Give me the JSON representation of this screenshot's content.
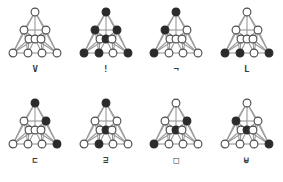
{
  "canvas": {
    "width": 282,
    "height": 182,
    "background": "#ffffff"
  },
  "style": {
    "edge_color": "#9a9a9a",
    "node_outline_color": "#4a4a4a",
    "node_open_fill": "#ffffff",
    "node_filled_fill": "#2b2b2b",
    "label_color": "#3a3a3a"
  },
  "graph_template": {
    "description": "Triangular tetractys-style graph with 10 nodes arranged in 4 rows and interior cross edges",
    "node_ids": [
      "apex",
      "u_left",
      "u_right",
      "m_left",
      "m_center",
      "m_right",
      "b_left",
      "b_center_left",
      "b_center_right",
      "b_right"
    ],
    "node_positions": [
      {
        "id": "apex",
        "x": 31,
        "y": 6
      },
      {
        "id": "u_left",
        "x": 20,
        "y": 24
      },
      {
        "id": "u_right",
        "x": 42,
        "y": 24
      },
      {
        "id": "m_left",
        "x": 25,
        "y": 33
      },
      {
        "id": "m_center",
        "x": 31,
        "y": 33
      },
      {
        "id": "m_right",
        "x": 37,
        "y": 33
      },
      {
        "id": "b_left",
        "x": 9,
        "y": 47
      },
      {
        "id": "b_center_left",
        "x": 24,
        "y": 47
      },
      {
        "id": "b_center_right",
        "x": 38,
        "y": 47
      },
      {
        "id": "b_right",
        "x": 53,
        "y": 47
      }
    ],
    "edges": [
      [
        "apex",
        "u_left"
      ],
      [
        "apex",
        "u_right"
      ],
      [
        "apex",
        "m_center"
      ],
      [
        "apex",
        "b_left"
      ],
      [
        "apex",
        "b_right"
      ],
      [
        "u_left",
        "u_right"
      ],
      [
        "u_left",
        "m_left"
      ],
      [
        "u_left",
        "m_center"
      ],
      [
        "u_right",
        "m_center"
      ],
      [
        "u_right",
        "m_right"
      ],
      [
        "u_left",
        "b_left"
      ],
      [
        "u_left",
        "b_center_left"
      ],
      [
        "u_right",
        "b_center_right"
      ],
      [
        "u_right",
        "b_right"
      ],
      [
        "m_left",
        "m_center"
      ],
      [
        "m_center",
        "m_right"
      ],
      [
        "m_left",
        "b_left"
      ],
      [
        "m_left",
        "b_center_left"
      ],
      [
        "m_center",
        "b_center_left"
      ],
      [
        "m_center",
        "b_center_right"
      ],
      [
        "m_right",
        "b_center_right"
      ],
      [
        "m_right",
        "b_right"
      ],
      [
        "b_left",
        "b_center_left"
      ],
      [
        "b_center_left",
        "b_center_right"
      ],
      [
        "b_center_right",
        "b_right"
      ],
      [
        "b_left",
        "m_center"
      ],
      [
        "b_right",
        "m_center"
      ]
    ]
  },
  "figures": [
    {
      "index": 1,
      "label": "V",
      "row": 1,
      "column": 1,
      "filled_nodes": []
    },
    {
      "index": 2,
      "label": "!",
      "row": 1,
      "column": 2,
      "filled_nodes": [
        "apex",
        "u_left",
        "u_right",
        "m_center",
        "b_left",
        "b_center_left",
        "b_right"
      ]
    },
    {
      "index": 3,
      "label": "¬",
      "row": 1,
      "column": 3,
      "filled_nodes": [
        "apex",
        "u_left",
        "b_left"
      ]
    },
    {
      "index": 4,
      "label": "L",
      "row": 1,
      "column": 4,
      "filled_nodes": [
        "b_left",
        "b_center_left",
        "b_right"
      ]
    },
    {
      "index": 5,
      "label": "⊏",
      "row": 2,
      "column": 1,
      "filled_nodes": [
        "apex",
        "u_right",
        "b_right"
      ]
    },
    {
      "index": 6,
      "label": "⊒",
      "row": 2,
      "column": 2,
      "filled_nodes": [
        "apex",
        "m_center",
        "b_center_left"
      ]
    },
    {
      "index": 7,
      "label": "□",
      "row": 2,
      "column": 3,
      "filled_nodes": [
        "u_right",
        "m_center",
        "b_left"
      ]
    },
    {
      "index": 8,
      "label": "⊌",
      "row": 2,
      "column": 4,
      "filled_nodes": [
        "u_left",
        "m_center",
        "b_right"
      ]
    }
  ]
}
